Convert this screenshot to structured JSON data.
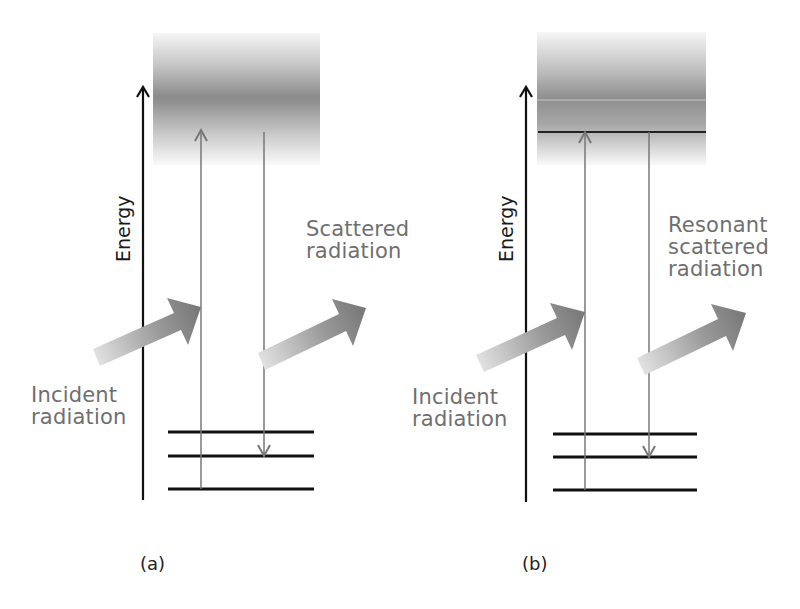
{
  "figure": {
    "panels": [
      {
        "id": "a",
        "caption": "(a)",
        "axis_label": "Energy",
        "incident_label_line1": "Incident",
        "incident_label_line2": "radiation",
        "scattered_label_lines": [
          "Scattered",
          "radiation"
        ],
        "virtual_state": "broad band (no discrete level)",
        "ground_levels": 3
      },
      {
        "id": "b",
        "caption": "(b)",
        "axis_label": "Energy",
        "incident_label_line1": "Incident",
        "incident_label_line2": "radiation",
        "scattered_label_lines": [
          "Resonant",
          "scattered",
          "radiation"
        ],
        "virtual_state": "broad band with discrete excited level",
        "ground_levels": 3
      }
    ],
    "colors": {
      "axis": "#111111",
      "level": "#111111",
      "transition": "#777777",
      "band_dark": "#8a8a8a",
      "band_light": "#f4f4f4",
      "arrow_dark": "#7a7a7a",
      "arrow_light": "#dcdcdc",
      "label_text": "#6f6f6f"
    }
  }
}
